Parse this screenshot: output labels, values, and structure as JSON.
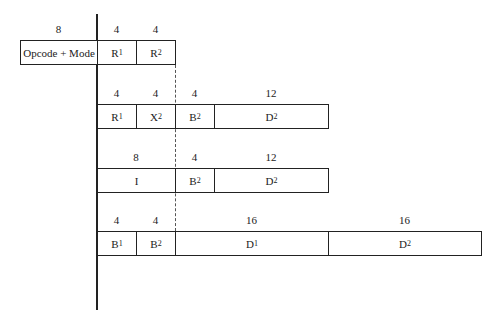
{
  "rows": [
    {
      "top": 40,
      "fields": [
        {
          "name": "Opcode + Mode",
          "sub": "",
          "bits": "8",
          "left": 20,
          "width": 77
        },
        {
          "name": "R",
          "sub": "1",
          "bits": "4",
          "left": 97,
          "width": 39
        },
        {
          "name": "R",
          "sub": "2",
          "bits": "4",
          "left": 136,
          "width": 39
        }
      ]
    },
    {
      "top": 104,
      "fields": [
        {
          "name": "R",
          "sub": "1",
          "bits": "4",
          "left": 97,
          "width": 39
        },
        {
          "name": "X",
          "sub": "2",
          "bits": "4",
          "left": 136,
          "width": 39
        },
        {
          "name": "B",
          "sub": "2",
          "bits": "4",
          "left": 175,
          "width": 39
        },
        {
          "name": "D",
          "sub": "2",
          "bits": "12",
          "left": 214,
          "width": 114
        }
      ]
    },
    {
      "top": 168,
      "fields": [
        {
          "name": "I",
          "sub": "",
          "bits": "8",
          "left": 97,
          "width": 78
        },
        {
          "name": "B",
          "sub": "2",
          "bits": "4",
          "left": 175,
          "width": 39
        },
        {
          "name": "D",
          "sub": "2",
          "bits": "12",
          "left": 214,
          "width": 114
        }
      ]
    },
    {
      "top": 231,
      "fields": [
        {
          "name": "B",
          "sub": "1",
          "bits": "4",
          "left": 97,
          "width": 39
        },
        {
          "name": "B",
          "sub": "2",
          "bits": "4",
          "left": 136,
          "width": 39
        },
        {
          "name": "D",
          "sub": "1",
          "bits": "16",
          "left": 175,
          "width": 153
        },
        {
          "name": "D",
          "sub": "2",
          "bits": "16",
          "left": 328,
          "width": 153
        }
      ]
    }
  ]
}
